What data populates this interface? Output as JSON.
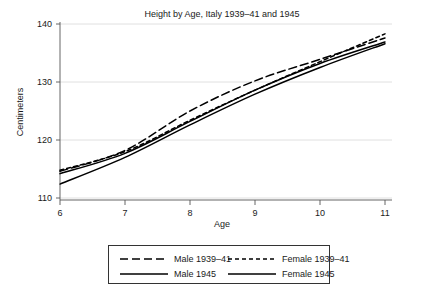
{
  "chart_data": {
    "type": "line",
    "title": "Height by Age, Italy 1939–41 and 1945",
    "xlabel": "Age",
    "ylabel": "Centimeters",
    "xlim": [
      6,
      11
    ],
    "ylim": [
      110,
      140
    ],
    "xticks": [
      6,
      7,
      8,
      9,
      10,
      11
    ],
    "xtick_labels": [
      "6",
      "7",
      "8",
      "9",
      "10",
      "11"
    ],
    "yticks": [
      110,
      120,
      130,
      140
    ],
    "ytick_labels": [
      "110",
      "120",
      "130",
      "140"
    ],
    "grid": "horizontal",
    "legend_position": "below",
    "x": [
      6,
      7,
      8,
      9,
      10,
      11
    ],
    "series": [
      {
        "name": "Male 1939–41",
        "dash": "8,4",
        "values": [
          114.6,
          118.2,
          125.0,
          130.2,
          133.9,
          137.6
        ]
      },
      {
        "name": "Female 1939–41",
        "dash": "4,3",
        "values": [
          114.8,
          118.0,
          123.4,
          128.6,
          133.5,
          138.3
        ]
      },
      {
        "name": "Male 1945",
        "dash": "none",
        "values": [
          114.2,
          117.7,
          123.2,
          128.6,
          133.2,
          136.9
        ]
      },
      {
        "name": "Female 1945",
        "dash": "none",
        "values": [
          112.4,
          117.0,
          122.6,
          127.9,
          132.5,
          136.6
        ]
      }
    ]
  },
  "legend": {
    "entries": [
      {
        "label": "Male 1939–41",
        "dash": "8,4"
      },
      {
        "label": "Female 1939–41",
        "dash": "4,3"
      },
      {
        "label": "Male 1945",
        "dash": "none"
      },
      {
        "label": "Female 1945",
        "dash": "none"
      }
    ]
  },
  "colors": {
    "line": "#000000",
    "grid": "#d8d8d8",
    "axis": "#555555",
    "background": "#ffffff",
    "text": "#1a1a1a"
  }
}
